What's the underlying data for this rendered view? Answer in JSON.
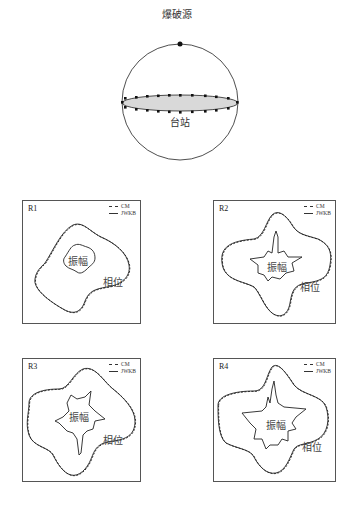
{
  "sphere": {
    "source_label": "爆破源",
    "station_label": "台站"
  },
  "legend": {
    "dashed": "CM",
    "solid": "JWKB"
  },
  "panels": [
    {
      "id": "R1",
      "amplitude_label": "振幅",
      "phase_label": "相位"
    },
    {
      "id": "R2",
      "amplitude_label": "振幅",
      "phase_label": "相位"
    },
    {
      "id": "R3",
      "amplitude_label": "振幅",
      "phase_label": "相位"
    },
    {
      "id": "R4",
      "amplitude_label": "振幅",
      "phase_label": "相位"
    }
  ],
  "colors": {
    "line": "#222222",
    "disk_fill": "#d9d9d9",
    "border": "#555555"
  }
}
